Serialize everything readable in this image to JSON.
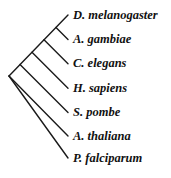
{
  "diagram": {
    "type": "phylogenetic-tree",
    "line_color": "#1a1a1a",
    "root": {
      "x": 9,
      "y": 76
    },
    "taxa": [
      {
        "name": "D. melanogaster",
        "tip_y": 15
      },
      {
        "name": "A. gambiae",
        "tip_y": 39
      },
      {
        "name": "C. elegans",
        "tip_y": 63
      },
      {
        "name": "H. sapiens",
        "tip_y": 88
      },
      {
        "name": "S. pombe",
        "tip_y": 112
      },
      {
        "name": "A. thaliana",
        "tip_y": 136
      },
      {
        "name": "P. falciparum",
        "tip_y": 158
      }
    ]
  }
}
